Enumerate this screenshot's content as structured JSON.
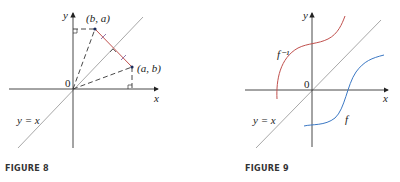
{
  "figures": [
    {
      "caption": "FIGURE 8",
      "axis_labels": {
        "x": "x",
        "y": "y"
      },
      "origin_label": "0",
      "line_label": "y = x",
      "points": [
        {
          "label": "(b, a)"
        },
        {
          "label": "(a, b)"
        }
      ],
      "colors": {
        "segment": "#c0504d",
        "line": "#a8a8a8",
        "axes": "#333333"
      }
    },
    {
      "caption": "FIGURE 9",
      "axis_labels": {
        "x": "x",
        "y": "y"
      },
      "origin_label": "0",
      "line_label": "y = x",
      "curves": [
        {
          "label": "f⁻¹",
          "color": "#c0504d"
        },
        {
          "label": "f",
          "color": "#3b78c4"
        }
      ]
    }
  ]
}
